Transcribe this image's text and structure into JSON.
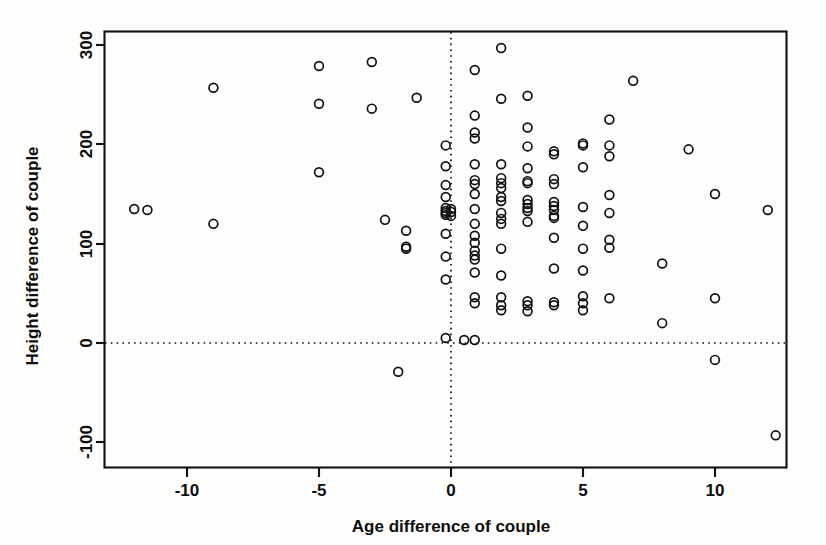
{
  "figure": {
    "background_color": "#fdfdfc",
    "foreground_color": "#111111"
  },
  "axis": {
    "x_title": "Age difference of couple",
    "y_title": "Height difference of couple",
    "x_ticks": [
      "-10",
      "-5",
      "0",
      "5",
      "10"
    ],
    "y_ticks": [
      "-100",
      "0",
      "100",
      "200",
      "300"
    ]
  },
  "reference_lines": {
    "vertical_label": "x = 0",
    "horizontal_label": "y = 0"
  },
  "chart_data": {
    "type": "scatter",
    "title": "",
    "xlabel": "Age difference of couple",
    "ylabel": "Height difference of couple",
    "xlim": [
      -13.0,
      13.2
    ],
    "ylim": [
      -120,
      320
    ],
    "xticks": [
      -10,
      -5,
      0,
      5,
      10
    ],
    "yticks": [
      -100,
      0,
      100,
      200,
      300
    ],
    "grid": false,
    "legend": false,
    "marker": "open-circle",
    "marker_size": 5,
    "reference_lines": [
      {
        "orientation": "vertical",
        "value": 0,
        "style": "dotted"
      },
      {
        "orientation": "horizontal",
        "value": 0,
        "style": "dotted"
      }
    ],
    "n_points": 124,
    "points": [
      [
        -12.0,
        135
      ],
      [
        -11.5,
        134
      ],
      [
        -9.0,
        257
      ],
      [
        -9.0,
        120
      ],
      [
        -5.0,
        279
      ],
      [
        -5.0,
        241
      ],
      [
        -5.0,
        172
      ],
      [
        -3.0,
        283
      ],
      [
        -3.0,
        236
      ],
      [
        -2.5,
        124
      ],
      [
        -2.0,
        -29
      ],
      [
        -1.7,
        113
      ],
      [
        -1.7,
        97
      ],
      [
        -1.7,
        95
      ],
      [
        -1.3,
        247
      ],
      [
        -0.2,
        199
      ],
      [
        -0.2,
        178
      ],
      [
        -0.2,
        159
      ],
      [
        -0.2,
        147
      ],
      [
        -0.2,
        136
      ],
      [
        -0.2,
        133
      ],
      [
        -0.2,
        131
      ],
      [
        -0.2,
        129
      ],
      [
        -0.2,
        110
      ],
      [
        -0.2,
        87
      ],
      [
        -0.2,
        64
      ],
      [
        -0.2,
        5
      ],
      [
        0.0,
        135
      ],
      [
        0.0,
        132
      ],
      [
        0.0,
        128
      ],
      [
        0.5,
        3
      ],
      [
        0.9,
        275
      ],
      [
        0.9,
        229
      ],
      [
        0.9,
        212
      ],
      [
        0.9,
        206
      ],
      [
        0.9,
        180
      ],
      [
        0.9,
        164
      ],
      [
        0.9,
        160
      ],
      [
        0.9,
        150
      ],
      [
        0.9,
        135
      ],
      [
        0.9,
        120
      ],
      [
        0.9,
        108
      ],
      [
        0.9,
        101
      ],
      [
        0.9,
        93
      ],
      [
        0.9,
        88
      ],
      [
        0.9,
        84
      ],
      [
        0.9,
        71
      ],
      [
        0.9,
        46
      ],
      [
        0.9,
        40
      ],
      [
        0.9,
        3
      ],
      [
        1.9,
        297
      ],
      [
        1.9,
        246
      ],
      [
        1.9,
        180
      ],
      [
        1.9,
        166
      ],
      [
        1.9,
        161
      ],
      [
        1.9,
        156
      ],
      [
        1.9,
        147
      ],
      [
        1.9,
        143
      ],
      [
        1.9,
        131
      ],
      [
        1.9,
        125
      ],
      [
        1.9,
        120
      ],
      [
        1.9,
        95
      ],
      [
        1.9,
        68
      ],
      [
        1.9,
        46
      ],
      [
        1.9,
        38
      ],
      [
        1.9,
        33
      ],
      [
        2.9,
        249
      ],
      [
        2.9,
        217
      ],
      [
        2.9,
        198
      ],
      [
        2.9,
        176
      ],
      [
        2.9,
        163
      ],
      [
        2.9,
        161
      ],
      [
        2.9,
        144
      ],
      [
        2.9,
        140
      ],
      [
        2.9,
        136
      ],
      [
        2.9,
        133
      ],
      [
        2.9,
        122
      ],
      [
        2.9,
        42
      ],
      [
        2.9,
        38
      ],
      [
        2.9,
        32
      ],
      [
        3.9,
        193
      ],
      [
        3.9,
        190
      ],
      [
        3.9,
        165
      ],
      [
        3.9,
        160
      ],
      [
        3.9,
        142
      ],
      [
        3.9,
        138
      ],
      [
        3.9,
        134
      ],
      [
        3.9,
        128
      ],
      [
        3.9,
        126
      ],
      [
        3.9,
        106
      ],
      [
        3.9,
        75
      ],
      [
        3.9,
        41
      ],
      [
        3.9,
        38
      ],
      [
        5.0,
        201
      ],
      [
        5.0,
        199
      ],
      [
        5.0,
        177
      ],
      [
        5.0,
        137
      ],
      [
        5.0,
        118
      ],
      [
        5.0,
        95
      ],
      [
        5.0,
        73
      ],
      [
        5.0,
        47
      ],
      [
        5.0,
        40
      ],
      [
        5.0,
        33
      ],
      [
        6.0,
        225
      ],
      [
        6.0,
        199
      ],
      [
        6.0,
        188
      ],
      [
        6.0,
        149
      ],
      [
        6.0,
        131
      ],
      [
        6.0,
        104
      ],
      [
        6.0,
        96
      ],
      [
        6.0,
        45
      ],
      [
        6.9,
        264
      ],
      [
        8.0,
        80
      ],
      [
        8.0,
        20
      ],
      [
        9.0,
        195
      ],
      [
        10.0,
        150
      ],
      [
        10.0,
        45
      ],
      [
        10.0,
        -17
      ],
      [
        12.0,
        134
      ],
      [
        12.3,
        -93
      ]
    ]
  }
}
